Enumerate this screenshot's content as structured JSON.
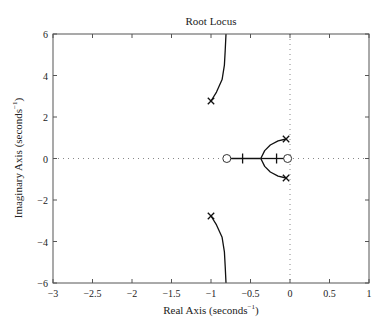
{
  "chart_data": {
    "type": "line",
    "title": "Root Locus",
    "xlabel": "Real Axis (seconds",
    "xlabel_sup": "−1",
    "ylabel": "Imaginary Axis (seconds",
    "ylabel_sup": "−1",
    "xlim": [
      -3,
      1
    ],
    "ylim": [
      -6,
      6
    ],
    "xticks": [
      -3,
      -2.5,
      -2,
      -1.5,
      -1,
      -0.5,
      0,
      0.5,
      1
    ],
    "xtick_labels": [
      "−3",
      "−2.5",
      "−2",
      "−1.5",
      "−1",
      "−0.5",
      "0",
      "0.5",
      "1"
    ],
    "yticks": [
      -6,
      -4,
      -2,
      0,
      2,
      4,
      6
    ],
    "ytick_labels": [
      "−6",
      "−4",
      "−2",
      "0",
      "2",
      "4",
      "6"
    ],
    "grid": false,
    "reference_lines": {
      "x_zero_dotted": true,
      "y_zero_dotted": true
    },
    "poles": [
      {
        "re": -1.0,
        "im": 2.77
      },
      {
        "re": -1.0,
        "im": -2.77
      },
      {
        "re": -0.05,
        "im": 0.94
      },
      {
        "re": -0.05,
        "im": -0.94
      }
    ],
    "zeros": [
      {
        "re": -0.8,
        "im": 0
      },
      {
        "re": -0.03,
        "im": 0
      }
    ],
    "series": [
      {
        "name": "branch-upper-far",
        "points": [
          [
            -1.0,
            2.77
          ],
          [
            -0.93,
            3.2
          ],
          [
            -0.86,
            3.8
          ],
          [
            -0.83,
            4.5
          ],
          [
            -0.82,
            5.2
          ],
          [
            -0.81,
            6.0
          ]
        ]
      },
      {
        "name": "branch-lower-far",
        "points": [
          [
            -1.0,
            -2.77
          ],
          [
            -0.93,
            -3.2
          ],
          [
            -0.86,
            -3.8
          ],
          [
            -0.83,
            -4.5
          ],
          [
            -0.82,
            -5.2
          ],
          [
            -0.81,
            -6.0
          ]
        ]
      },
      {
        "name": "branch-upper-near",
        "points": [
          [
            -0.05,
            0.94
          ],
          [
            -0.15,
            0.85
          ],
          [
            -0.25,
            0.65
          ],
          [
            -0.32,
            0.38
          ],
          [
            -0.37,
            0.0
          ]
        ]
      },
      {
        "name": "branch-lower-near",
        "points": [
          [
            -0.05,
            -0.94
          ],
          [
            -0.15,
            -0.85
          ],
          [
            -0.25,
            -0.65
          ],
          [
            -0.32,
            -0.38
          ],
          [
            -0.37,
            0.0
          ]
        ]
      },
      {
        "name": "real-axis-left",
        "points": [
          [
            -0.37,
            0.0
          ],
          [
            -0.8,
            0.0
          ]
        ]
      },
      {
        "name": "real-axis-right",
        "points": [
          [
            -0.37,
            0.0
          ],
          [
            -0.03,
            0.0
          ]
        ]
      }
    ],
    "real_axis_tick_marks": [
      -0.6,
      -0.17
    ],
    "breakaway_point": {
      "re": -0.37,
      "im": 0
    },
    "legend": null
  }
}
